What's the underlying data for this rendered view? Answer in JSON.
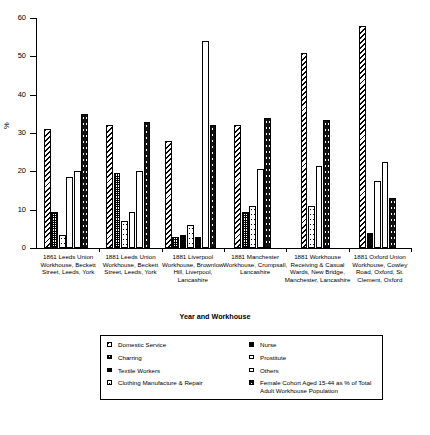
{
  "chart_data": {
    "type": "bar",
    "title": "",
    "xlabel": "Year and Workhouse",
    "ylabel": "%",
    "ylim": [
      0,
      60
    ],
    "yticks": [
      0,
      10,
      20,
      30,
      40,
      50,
      60
    ],
    "grid": false,
    "legend_position": "below",
    "categories": [
      "1861 Leeds Union Workhouse, Beckett Street, Leeds, York",
      "1881 Leeds Union Workhouse, Beckett Street, Leeds, York",
      "1881 Liverpool Workhouse, Brownlow Hill, Liverpool, Lancashire",
      "1881 Manchester Workhouse, Crumpsall, Lancashire",
      "1881 Workhouse Receiving & Casual Wards, New Bridge, Manchester, Lancashire",
      "1881 Oxford Union Workhouse, Cowley Road, Oxford, St. Clement, Oxford"
    ],
    "series": [
      {
        "name": "Domestic Service",
        "pattern": "diagonal-hatch",
        "values": [
          31,
          32,
          28,
          32,
          51,
          58
        ]
      },
      {
        "name": "Charring",
        "pattern": "dense-checker",
        "values": [
          9.5,
          19.5,
          3,
          9.5,
          0,
          0
        ]
      },
      {
        "name": "Textile Workers",
        "pattern": "solid-black",
        "values": [
          0,
          0,
          3.5,
          0,
          0,
          4
        ]
      },
      {
        "name": "Clothing Manufacture & Repair",
        "pattern": "sparse-dots",
        "values": [
          3.5,
          7,
          6,
          11,
          11,
          0
        ]
      },
      {
        "name": "Nurse",
        "pattern": "solid-black-narrow",
        "values": [
          0,
          0,
          3,
          0,
          0,
          0
        ]
      },
      {
        "name": "Prostitute",
        "pattern": "white-outline",
        "values": [
          18.5,
          9.5,
          0,
          0,
          0,
          17.5
        ]
      },
      {
        "name": "Others",
        "pattern": "light-dots",
        "values": [
          20,
          20,
          54,
          20.5,
          21.5,
          22.5
        ]
      },
      {
        "name": "Female Cohort Aged 15-44 as % of Total Adult Workhouse Population",
        "pattern": "speckled-black",
        "values": [
          35,
          33,
          32,
          34,
          33.5,
          13
        ]
      }
    ]
  },
  "axes": {
    "y_title": "%",
    "x_title": "Year and Workhouse",
    "y_tick_labels": [
      "0",
      "10",
      "20",
      "30",
      "40",
      "50",
      "60"
    ]
  },
  "legend": {
    "left_column": [
      "Domestic Service",
      "Charring",
      "Textile Workers",
      "Clothing Manufacture & Repair"
    ],
    "right_column": [
      "Nurse",
      "Prostitute",
      "Others",
      "Female Cohort Aged 15-44 as % of Total Adult Workhouse Population"
    ]
  },
  "x_labels": [
    "1861 Leeds Union Workhouse, Beckett Street, Leeds, York",
    "1881 Leeds Union Workhouse, Beckett Street, Leeds, York",
    "1881 Liverpool Workhouse, Brownlow Hill, Liverpool, Lancashire",
    "1881 Manchester Workhouse, Crumpsall, Lancashire",
    "1881 Workhouse Receiving & Casual Wards, New Bridge, Manchester, Lancashire",
    "1881 Oxford Union Workhouse, Cowley Road, Oxford, St. Clement, Oxford"
  ]
}
